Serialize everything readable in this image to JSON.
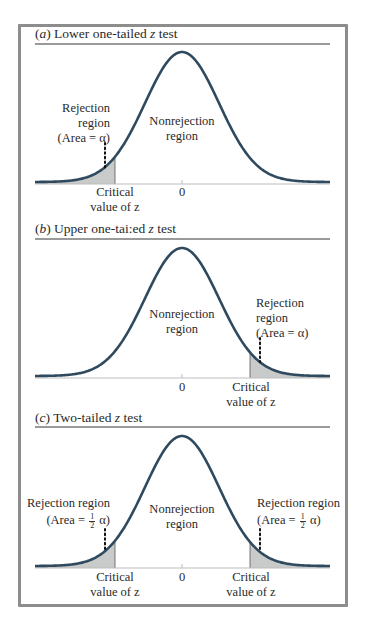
{
  "figure": {
    "frame_color": "#8d8d8d",
    "rule_color": "#9a9a9a",
    "curve_color": "#2f4a5e",
    "shade_color": "#c9caca",
    "axis_color": "#bdbdbd",
    "zero_label": "0",
    "critical_label_line1": "Critical",
    "critical_label_line2": "value of z"
  },
  "panels": [
    {
      "id": "a",
      "letter": "a",
      "title": "Lower one-tailed z test",
      "title_prefix": "(",
      "title_suffix_pre": ") Lower one-tailed ",
      "title_z": "z",
      "title_tail": " test",
      "tails": "lower",
      "rejection_label": [
        "Rejection",
        "region",
        "(Area = α)"
      ],
      "nonrejection_label": [
        "Nonrejection",
        "region"
      ]
    },
    {
      "id": "b",
      "letter": "b",
      "title": "Upper one-tailed z test",
      "title_prefix": "(",
      "title_suffix_pre": ") Upper one-tai:ed ",
      "title_z": "z",
      "title_tail": " test",
      "tails": "upper",
      "rejection_label": [
        "Rejection",
        "region",
        "(Area = α)"
      ],
      "nonrejection_label": [
        "Nonrejection",
        "region"
      ]
    },
    {
      "id": "c",
      "letter": "c",
      "title": "Two-tailed z test",
      "title_prefix": "(",
      "title_suffix_pre": ") Two-tailed ",
      "title_z": "z",
      "title_tail": " test",
      "tails": "two",
      "rejection_label_left": [
        "Rejection region",
        "(Area = ½ α)"
      ],
      "rejection_label_right": [
        "Rejection region",
        "(Area = ½ α)"
      ],
      "area_prefix": "(Area = ",
      "area_frac_num": "1",
      "area_frac_den": "2",
      "area_suffix": " α)",
      "nonrejection_label": [
        "Nonrejection",
        "region"
      ]
    }
  ],
  "chart_data": {
    "type": "area",
    "xlabel": "z",
    "ylabel": "",
    "x_ticks": [
      "Critical value of z",
      "0",
      "Critical value of z"
    ],
    "curves": [
      {
        "panel": "(a) Lower one-tailed z test",
        "distribution": "standard normal",
        "shaded": "lower tail",
        "shaded_area": "α",
        "critical_z_approx": -1.8
      },
      {
        "panel": "(b) Upper one-tailed z test",
        "distribution": "standard normal",
        "shaded": "upper tail",
        "shaded_area": "α",
        "critical_z_approx": 1.8
      },
      {
        "panel": "(c) Two-tailed z test",
        "distribution": "standard normal",
        "shaded": "both tails",
        "shaded_area_each": "1/2 α",
        "critical_z_approx": [
          -1.8,
          1.8
        ]
      }
    ],
    "annotations": [
      "Rejection region",
      "Nonrejection region",
      "Area = α",
      "Area = 1/2 α"
    ],
    "grid": false
  }
}
